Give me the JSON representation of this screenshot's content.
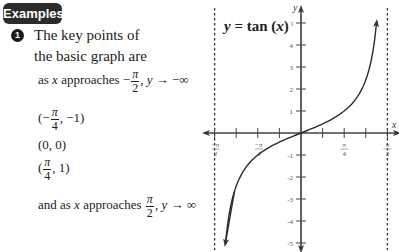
{
  "badge": {
    "label": "Examples"
  },
  "bullet": {
    "number": "1"
  },
  "text": {
    "line1": "The key points of",
    "line2": "the basic graph are",
    "approach_neg": {
      "prefix": "as ",
      "var": "x",
      "mid": " approaches −",
      "num": "π",
      "den": "2",
      "suffix_var": "y",
      "suffix": " → −∞"
    },
    "point1": {
      "open": "(−",
      "num": "π",
      "den": "4",
      "close": ", −1)"
    },
    "point2": {
      "label": "(0, 0)"
    },
    "point3": {
      "open": "(",
      "num": "π",
      "den": "4",
      "close": ", 1)"
    },
    "approach_pos": {
      "prefix": "and as ",
      "var": "x",
      "mid": " approaches ",
      "num": "π",
      "den": "2",
      "suffix_var": "y",
      "suffix": " → ∞"
    }
  },
  "graph": {
    "equation": {
      "lhs": "y",
      "eq": " = tan (",
      "var": "x",
      "rhs": ")"
    },
    "x_axis_label": "x",
    "y_axis_label": "y",
    "colors": {
      "curve": "#2a2a2a",
      "axis": "#444444",
      "asymptote": "#333333"
    }
  },
  "chart_data": {
    "type": "line",
    "title": "y = tan (x)",
    "function": "tan(x)",
    "xlabel": "x",
    "ylabel": "y",
    "xlim": [
      -1.5708,
      1.5708
    ],
    "ylim": [
      -5,
      5
    ],
    "x_ticks": [
      -1.5708,
      -1.1781,
      -0.7854,
      -0.3927,
      0,
      0.3927,
      0.7854,
      1.1781,
      1.5708
    ],
    "x_tick_labels": [
      {
        "value": -1.5708,
        "label": "−π/2"
      },
      {
        "value": -0.7854,
        "label": "−π/4"
      },
      {
        "value": 0.7854,
        "label": "π/4"
      },
      {
        "value": 1.5708,
        "label": "π/2"
      }
    ],
    "y_ticks": [
      -5,
      -4,
      -3,
      -2,
      -1,
      1,
      2,
      3,
      4,
      5
    ],
    "y_tick_labels": [
      "-5",
      "-4",
      "-3",
      "-2",
      "-1",
      "1",
      "2",
      "3",
      "4",
      "5"
    ],
    "asymptotes": [
      -1.5708,
      1.5708
    ],
    "key_points": [
      {
        "x": -0.7854,
        "y": -1
      },
      {
        "x": 0,
        "y": 0
      },
      {
        "x": 0.7854,
        "y": 1
      }
    ],
    "grid": false
  }
}
